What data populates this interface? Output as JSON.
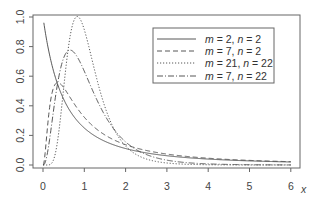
{
  "chart_data": {
    "type": "line",
    "title": "",
    "xlabel": "x",
    "ylabel": "",
    "xlim": [
      0,
      6
    ],
    "ylim": [
      0,
      1.0
    ],
    "grid": false,
    "legend_position": "top-right (inside)",
    "x_ticks": [
      "0",
      "1",
      "2",
      "3",
      "4",
      "5",
      "6"
    ],
    "y_ticks": [
      "0.0",
      "0.2",
      "0.4",
      "0.6",
      "0.8",
      "1.0"
    ],
    "x": [
      0,
      0.25,
      0.5,
      0.75,
      1,
      1.5,
      2,
      3,
      4,
      5,
      6
    ],
    "series": [
      {
        "name": "m = 2, n = 2",
        "m": 2,
        "n": 2,
        "style": "solid",
        "values": [
          1.0,
          0.64,
          0.444,
          0.327,
          0.25,
          0.16,
          0.111,
          0.063,
          0.04,
          0.028,
          0.02
        ]
      },
      {
        "name": "m = 7, n = 2",
        "m": 7,
        "n": 2,
        "style": "dashed",
        "values": [
          0.0,
          0.33,
          0.55,
          0.5,
          0.42,
          0.28,
          0.19,
          0.1,
          0.06,
          0.04,
          0.03
        ]
      },
      {
        "name": "m = 21, n = 22",
        "m": 21,
        "n": 22,
        "style": "dotted",
        "values": [
          0.0,
          0.0,
          0.43,
          0.97,
          0.93,
          0.42,
          0.12,
          0.01,
          0.0,
          0.0,
          0.0
        ]
      },
      {
        "name": "m = 7, n = 22",
        "m": 7,
        "n": 22,
        "style": "dashdot",
        "values": [
          0.0,
          0.32,
          0.72,
          0.77,
          0.64,
          0.32,
          0.13,
          0.03,
          0.01,
          0.0,
          0.0
        ]
      }
    ]
  },
  "axes": {
    "x_axis_label": "x",
    "x_tick_labels": [
      "0",
      "1",
      "2",
      "3",
      "4",
      "5",
      "6"
    ],
    "y_tick_labels": [
      "0.0",
      "0.2",
      "0.4",
      "0.6",
      "0.8",
      "1.0"
    ]
  },
  "legend": {
    "entries": [
      {
        "m_label": "m",
        "m_value": "2",
        "n_label": "n",
        "n_value": "2"
      },
      {
        "m_label": "m",
        "m_value": "7",
        "n_label": "n",
        "n_value": "2"
      },
      {
        "m_label": "m",
        "m_value": "21",
        "n_label": "n",
        "n_value": "22"
      },
      {
        "m_label": "m",
        "m_value": "7",
        "n_label": "n",
        "n_value": "22"
      }
    ]
  },
  "colors": {
    "axis": "#555555",
    "curve": "#444444",
    "legend_border": "#666666"
  }
}
